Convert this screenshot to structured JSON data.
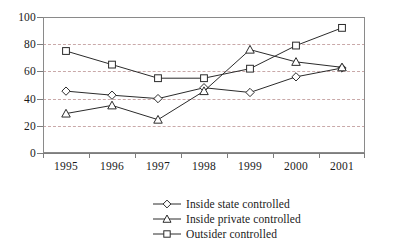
{
  "chart_data": {
    "type": "line",
    "title": "",
    "subtitle": "",
    "xlabel": "",
    "ylabel": "",
    "categories": [
      "1995",
      "1996",
      "1997",
      "1998",
      "1999",
      "2000",
      "2001"
    ],
    "ylim": [
      0,
      100
    ],
    "yticks": [
      0,
      20,
      40,
      60,
      80,
      100
    ],
    "ytick_labels": [
      "0",
      "20",
      "40",
      "60",
      "80",
      "100"
    ],
    "grid": "horizontal dashed gridlines at every 20 units",
    "legend_position": "bottom-center",
    "series": [
      {
        "name": "Inside state controlled",
        "marker": "diamond",
        "values": [
          45.5,
          42.5,
          40,
          48,
          44.5,
          56,
          62.5
        ]
      },
      {
        "name": "Inside private controlled",
        "marker": "triangle",
        "values": [
          29,
          35,
          24.5,
          45.5,
          76,
          67,
          63
        ]
      },
      {
        "name": "Outsider controlled",
        "marker": "square",
        "values": [
          75,
          65,
          55,
          55,
          62,
          79,
          92
        ]
      }
    ],
    "annotations": []
  },
  "legend": {
    "items": [
      {
        "label": "Inside state controlled",
        "marker": "diamond-marker-icon"
      },
      {
        "label": "Inside private controlled",
        "marker": "triangle-marker-icon"
      },
      {
        "label": "Outsider controlled",
        "marker": "square-marker-icon"
      }
    ]
  },
  "colors": {
    "line": "#2b2b2b",
    "marker_fill": "#ffffff",
    "gridline": "#c9a9a9",
    "axis": "#7d7d7d",
    "frame": "#8a8a8a",
    "background": "#ffffff",
    "text": "#1a1a1a"
  }
}
